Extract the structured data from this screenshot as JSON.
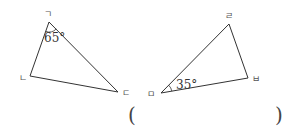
{
  "triangles": [
    {
      "name": "triangle-left",
      "vertices": [
        {
          "label": "ㄱ",
          "x": 49,
          "y": 22,
          "lx": 44,
          "ly": 17
        },
        {
          "label": "ㄴ",
          "x": 30,
          "y": 76,
          "lx": 19,
          "ly": 81
        },
        {
          "label": "ㄷ",
          "x": 118,
          "y": 92,
          "lx": 122,
          "ly": 96
        }
      ],
      "angle": {
        "vertex": "ㄱ",
        "value": "65°",
        "tx": 44,
        "ty": 42
      }
    },
    {
      "name": "triangle-right",
      "vertices": [
        {
          "label": "ㄹ",
          "x": 229,
          "y": 24,
          "lx": 225,
          "ly": 19
        },
        {
          "label": "ㅁ",
          "x": 161,
          "y": 93,
          "lx": 147,
          "ly": 97
        },
        {
          "label": "ㅂ",
          "x": 248,
          "y": 78,
          "lx": 252,
          "ly": 82
        }
      ],
      "angle": {
        "vertex": "ㅁ",
        "value": "35°",
        "tx": 176,
        "ty": 89
      }
    }
  ],
  "answer": {
    "open": "(",
    "close": ")",
    "value": ""
  },
  "colors": {
    "line": "#333333",
    "label": "#555555"
  }
}
